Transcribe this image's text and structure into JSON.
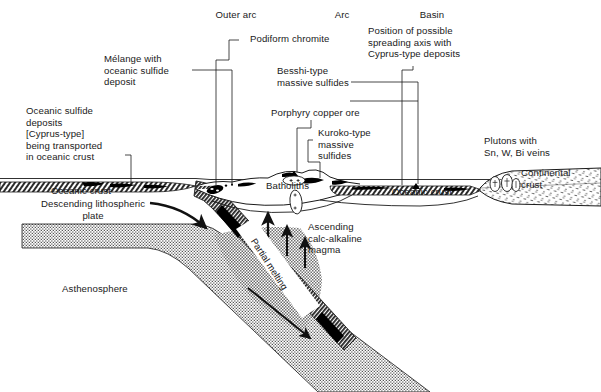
{
  "figure": {
    "type": "geological-cross-section",
    "background_color": "#ffffff",
    "ink_color": "#1a1a1a"
  },
  "zone_headings": [
    {
      "id": "outer-arc",
      "label": "Outer arc",
      "x": 233,
      "y": 15
    },
    {
      "id": "arc",
      "label": "Arc",
      "x": 341,
      "y": 15
    },
    {
      "id": "basin",
      "label": "Basin",
      "x": 430,
      "y": 15
    }
  ],
  "annotations": [
    {
      "id": "podiform-chromite",
      "label": "Podiform chromite",
      "lines": [
        "Podiform chromite"
      ],
      "x": 250,
      "y": 38,
      "align": "left"
    },
    {
      "id": "melange-oceanic-sulfide",
      "label": "Mélange with oceanic sulfide deposit",
      "lines": [
        "Mélange with",
        "oceanic sulfide",
        "deposit"
      ],
      "x": 104,
      "y": 58,
      "align": "left"
    },
    {
      "id": "besshi-type-massive-sulfides",
      "label": "Besshi-type massive sulfides",
      "lines": [
        "Besshi-type",
        "massive sulfides"
      ],
      "x": 277,
      "y": 70,
      "align": "left"
    },
    {
      "id": "spreading-axis-cyprus",
      "label": "Position of possible spreading axis with Cyprus-type deposits",
      "lines": [
        "Position of possible",
        "spreading axis with",
        "Cyprus-type deposits"
      ],
      "x": 368,
      "y": 30,
      "align": "left"
    },
    {
      "id": "porphyry-copper-ore",
      "label": "Porphyry copper ore",
      "lines": [
        "Porphyry copper ore"
      ],
      "x": 271,
      "y": 112,
      "align": "left"
    },
    {
      "id": "kuroko-type-massive-sulfides",
      "label": "Kuroko-type massive sulfides",
      "lines": [
        "Kuroko-type",
        "massive",
        "sulfides"
      ],
      "x": 318,
      "y": 132,
      "align": "left"
    },
    {
      "id": "oceanic-sulfide-deposits-transported",
      "label": "Oceanic sulfide deposits [Cyprus-type] being transported in oceanic crust",
      "lines": [
        "Oceanic sulfide",
        "deposits",
        "[Cyprus-type]",
        "being transported",
        "in oceanic crust"
      ],
      "x": 26,
      "y": 110,
      "align": "left"
    },
    {
      "id": "plutons-sn-w-bi",
      "label": "Plutons with Sn, W, Bi veins",
      "lines": [
        "Plutons with",
        "Sn, W, Bi veins"
      ],
      "x": 484,
      "y": 140,
      "align": "left"
    },
    {
      "id": "continental-crust",
      "label": "Continental crust",
      "lines": [
        "Continental",
        "crust"
      ],
      "x": 521,
      "y": 172,
      "align": "left"
    },
    {
      "id": "oceanic-crust-left",
      "label": "Oceanic crust",
      "lines": [
        "Oceanic crust"
      ],
      "x": 51,
      "y": 190,
      "align": "left"
    },
    {
      "id": "oceanic-crust-basin",
      "label": "Oceanic crust",
      "lines": [
        "Oceanic crust"
      ],
      "x": 392,
      "y": 191,
      "align": "left"
    },
    {
      "id": "batholiths",
      "label": "Batholiths",
      "lines": [
        "Batholiths"
      ],
      "x": 268,
      "y": 185,
      "align": "left"
    },
    {
      "id": "descending-lithospheric-plate",
      "label": "Descending lithospheric plate",
      "lines": [
        "Descending lithospheric",
        "plate"
      ],
      "x": 41,
      "y": 203,
      "align": "left"
    },
    {
      "id": "ascending-calc-alkaline-magma",
      "label": "Ascending calc-alkaline magma",
      "lines": [
        "Ascending",
        "calc-alkaline",
        "magma"
      ],
      "x": 308,
      "y": 226,
      "align": "left"
    },
    {
      "id": "asthenosphere",
      "label": "Asthenosphere",
      "lines": [
        "Asthenosphere"
      ],
      "x": 62,
      "y": 288,
      "align": "left"
    },
    {
      "id": "partial-melting",
      "label": "Partial melting",
      "lines": [
        "Partial melting"
      ],
      "x": 258,
      "y": 236,
      "align": "left",
      "rotation_deg": 57
    }
  ],
  "layers": [
    {
      "id": "sea-level-line",
      "name": "sea level",
      "color": "#1a1a1a"
    },
    {
      "id": "oceanic-crust-band",
      "name": "Oceanic crust",
      "fill": "hatch-dense-gray"
    },
    {
      "id": "sulfide-lenses",
      "name": "Oceanic sulfide deposits",
      "fill": "#000000"
    },
    {
      "id": "lithospheric-mantle",
      "name": "Descending lithospheric plate",
      "fill": "stipple-gray"
    },
    {
      "id": "asthenosphere-region",
      "name": "Asthenosphere",
      "fill": "#ffffff"
    },
    {
      "id": "subducting-slab",
      "name": "subducting oceanic crust slab",
      "fill": "hatch-dark"
    },
    {
      "id": "magma-wedge",
      "name": "Ascending calc-alkaline magma",
      "fill": "checker-gray"
    },
    {
      "id": "continental-crust-block",
      "name": "Continental crust",
      "fill": "stipple-sparse"
    },
    {
      "id": "arc-edifice",
      "name": "Arc",
      "fill": "#ffffff"
    },
    {
      "id": "batholith-bodies",
      "name": "Batholiths",
      "fill": "#ffffff"
    }
  ]
}
